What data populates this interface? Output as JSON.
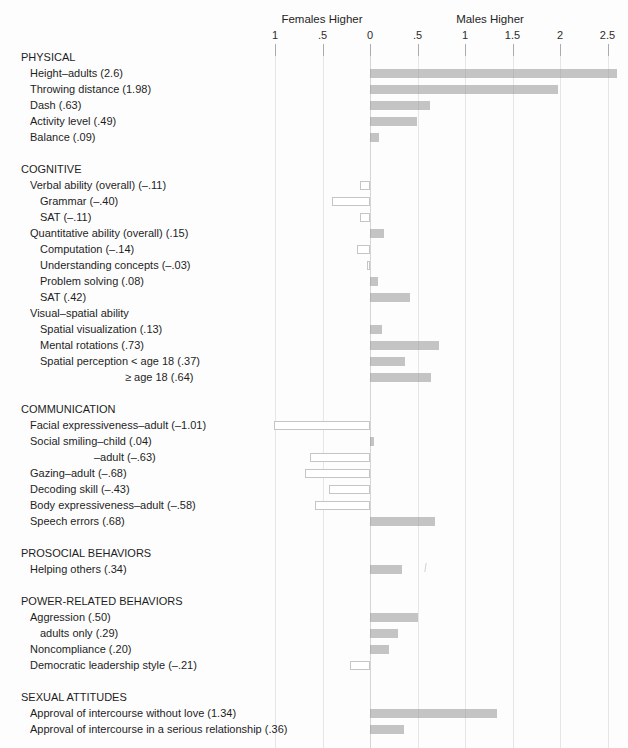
{
  "header": {
    "left_label": "Females Higher",
    "right_label": "Males Higher"
  },
  "colors": {
    "bar_fill": "#c9c9c9",
    "bar_outline": "#c5c5c5",
    "gridline": "#e6e6e6",
    "zero_line": "#d5d5d5",
    "tick_mark": "#ababab",
    "text": "#1d1d1d"
  },
  "chart_data": {
    "type": "bar",
    "orientation": "horizontal",
    "value_meaning": "effect size d (positive = males higher, negative = females higher)",
    "xlim": [
      -1.25,
      2.75
    ],
    "grid": true,
    "bar_style": {
      "positive": "filled gray",
      "negative": "open white with gray outline"
    },
    "axis_ticks": [
      {
        "label": "1",
        "value": -1
      },
      {
        "label": ".5",
        "value": -0.5
      },
      {
        "label": "0",
        "value": 0
      },
      {
        "label": ".5",
        "value": 0.5
      },
      {
        "label": "1",
        "value": 1
      },
      {
        "label": "1.5",
        "value": 1.5
      },
      {
        "label": "2",
        "value": 2
      },
      {
        "label": "2.5",
        "value": 2.5
      }
    ],
    "rows": [
      {
        "kind": "section",
        "indent": 0,
        "label": "PHYSICAL",
        "value": null
      },
      {
        "kind": "item",
        "indent": 1,
        "label": "Height–adults (2.6)",
        "value": 2.6
      },
      {
        "kind": "item",
        "indent": 1,
        "label": "Throwing distance (1.98)",
        "value": 1.98
      },
      {
        "kind": "item",
        "indent": 1,
        "label": "Dash (.63)",
        "value": 0.63
      },
      {
        "kind": "item",
        "indent": 1,
        "label": "Activity level (.49)",
        "value": 0.49
      },
      {
        "kind": "item",
        "indent": 1,
        "label": "Balance (.09)",
        "value": 0.09
      },
      {
        "kind": "section",
        "indent": 0,
        "label": "COGNITIVE",
        "value": null
      },
      {
        "kind": "item",
        "indent": 1,
        "label": "Verbal ability (overall) (–.11)",
        "value": -0.11
      },
      {
        "kind": "item",
        "indent": 2,
        "label": "Grammar (–.40)",
        "value": -0.4
      },
      {
        "kind": "item",
        "indent": 2,
        "label": "SAT (–.11)",
        "value": -0.11
      },
      {
        "kind": "item",
        "indent": 1,
        "label": "Quantitative ability (overall) (.15)",
        "value": 0.15
      },
      {
        "kind": "item",
        "indent": 2,
        "label": "Computation (–.14)",
        "value": -0.14
      },
      {
        "kind": "item",
        "indent": 2,
        "label": "Understanding concepts (–.03)",
        "value": -0.03
      },
      {
        "kind": "item",
        "indent": 2,
        "label": "Problem solving (.08)",
        "value": 0.08
      },
      {
        "kind": "item",
        "indent": 2,
        "label": "SAT (.42)",
        "value": 0.42
      },
      {
        "kind": "item",
        "indent": 1,
        "label": "Visual–spatial ability",
        "value": null
      },
      {
        "kind": "item",
        "indent": 2,
        "label": "Spatial visualization (.13)",
        "value": 0.13
      },
      {
        "kind": "item",
        "indent": 2,
        "label": "Mental rotations (.73)",
        "value": 0.73
      },
      {
        "kind": "item",
        "indent": 2,
        "label": "Spatial perception < age 18 (.37)",
        "value": 0.37
      },
      {
        "kind": "item",
        "indent": 4,
        "label": "≥ age 18 (.64)",
        "value": 0.64
      },
      {
        "kind": "section",
        "indent": 0,
        "label": "COMMUNICATION",
        "value": null
      },
      {
        "kind": "item",
        "indent": 1,
        "label": "Facial expressiveness–adult (–1.01)",
        "value": -1.01
      },
      {
        "kind": "item",
        "indent": 1,
        "label": "Social smiling–child (.04)",
        "value": 0.04
      },
      {
        "kind": "item",
        "indent": 3,
        "label": "–adult (–.63)",
        "value": -0.63
      },
      {
        "kind": "item",
        "indent": 1,
        "label": "Gazing–adult (–.68)",
        "value": -0.68
      },
      {
        "kind": "item",
        "indent": 1,
        "label": "Decoding skill (–.43)",
        "value": -0.43
      },
      {
        "kind": "item",
        "indent": 1,
        "label": "Body expressiveness–adult (–.58)",
        "value": -0.58
      },
      {
        "kind": "item",
        "indent": 1,
        "label": "Speech errors (.68)",
        "value": 0.68
      },
      {
        "kind": "section",
        "indent": 0,
        "label": "PROSOCIAL BEHAVIORS",
        "value": null
      },
      {
        "kind": "item",
        "indent": 1,
        "label": "Helping others (.34)",
        "value": 0.34
      },
      {
        "kind": "section",
        "indent": 0,
        "label": "POWER-RELATED BEHAVIORS",
        "value": null
      },
      {
        "kind": "item",
        "indent": 1,
        "label": "Aggression (.50)",
        "value": 0.5
      },
      {
        "kind": "item",
        "indent": 2,
        "label": "adults only (.29)",
        "value": 0.29
      },
      {
        "kind": "item",
        "indent": 1,
        "label": "Noncompliance (.20)",
        "value": 0.2
      },
      {
        "kind": "item",
        "indent": 1,
        "label": "Democratic leadership style (–.21)",
        "value": -0.21
      },
      {
        "kind": "section",
        "indent": 0,
        "label": "SEXUAL ATTITUDES",
        "value": null
      },
      {
        "kind": "item",
        "indent": 1,
        "label": "Approval of intercourse without love (1.34)",
        "value": 1.34
      },
      {
        "kind": "item",
        "indent": 1,
        "label": "Approval of intercourse in a serious relationship (.36)",
        "value": 0.36
      }
    ]
  }
}
